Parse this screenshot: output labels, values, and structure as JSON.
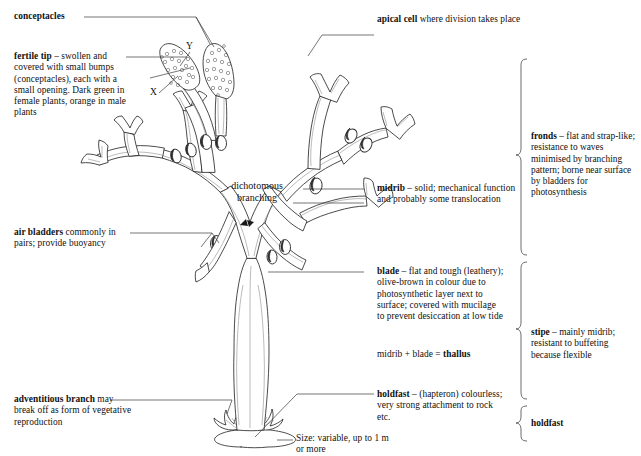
{
  "labels": {
    "conceptacles": "conceptacles",
    "fertile_tip_bold": "fertile tip",
    "fertile_tip_rest": " – swollen and covered with small bumps (conceptacles), each with a small opening. Dark green in female plants, orange in male plants",
    "apical_cell_bold": "apical cell",
    "apical_cell_rest": " where division takes place",
    "air_bladders_bold": "air bladders",
    "air_bladders_rest": " commonly in pairs; provide buoyancy",
    "adventitious_bold": "adventitious branch",
    "adventitious_rest": " may break off as form of vegetative reproduction",
    "dichotomous_line1": "dichotomous",
    "dichotomous_line2": "branching",
    "midrib_bold": "midrib",
    "midrib_rest": " – solid; mechanical function and probably some translocation",
    "blade_bold": "blade",
    "blade_rest": " – flat and tough (leathery); olive-brown in colour due to photosynthetic layer next to surface; covered with mucilage to prevent desiccation at low tide",
    "thallus_prefix": "midrib + blade = ",
    "thallus_bold": "thallus",
    "holdfast_bold": "holdfast",
    "holdfast_rest": " – (hapteron) colourless; very strong attachment to rock etc.",
    "size_line1": "Size: variable, up to 1 m",
    "size_line2": "or more",
    "marker_x": "X",
    "marker_y": "Y"
  },
  "groups": {
    "fronds_bold": "fronds",
    "fronds_rest": " – flat and strap-like; resistance to waves minimised by branching pattern; borne near surface by bladders for photosynthesis",
    "stipe_bold": "stipe",
    "stipe_rest": " – mainly midrib; resistant to buffeting because flexible",
    "holdfast_group": "holdfast"
  },
  "colors": {
    "ink": "#1a1a1a",
    "outline": "#2a2a2a",
    "leader": "#3b3b3b",
    "vein": "#8d8d8d",
    "background": "#ffffff"
  }
}
